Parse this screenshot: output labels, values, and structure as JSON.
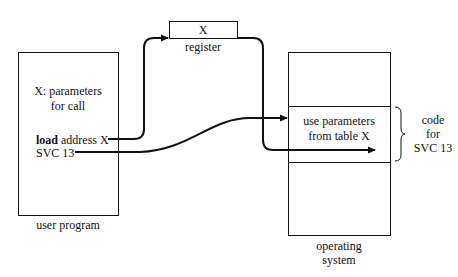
{
  "user_program": {
    "title": "user program",
    "param_line1": "X: parameters",
    "param_line2": "for call",
    "load_keyword": "load",
    "load_rest": " address X",
    "svc_line": "SVC 13"
  },
  "register": {
    "value": "X",
    "label": "register"
  },
  "operating_system": {
    "label_line1": "operating",
    "label_line2": "system",
    "code_line1": "use parameters",
    "code_line2": "from table X"
  },
  "brace_label": {
    "line1": "code",
    "line2": "for",
    "line3": "SVC 13"
  },
  "colors": {
    "stroke": "#111111",
    "background": "#ffffff"
  }
}
